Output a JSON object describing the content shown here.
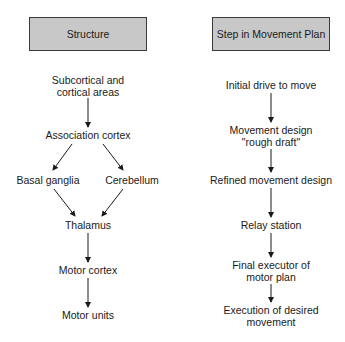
{
  "columns": {
    "left": {
      "header": "Structure",
      "nodes": {
        "subcortical": {
          "line1": "Subcortical and",
          "line2": "cortical areas"
        },
        "association": "Association cortex",
        "basal": "Basal ganglia",
        "cerebellum": "Cerebellum",
        "thalamus": "Thalamus",
        "motor_cortex": "Motor cortex",
        "motor_units": "Motor units"
      }
    },
    "right": {
      "header": "Step in Movement Plan",
      "nodes": {
        "initial": "Initial drive to move",
        "design": {
          "line1": "Movement design",
          "line2": "\"rough draft\""
        },
        "refined": "Refined movement design",
        "relay": "Relay station",
        "final": {
          "line1": "Final executor of",
          "line2": "motor plan"
        },
        "execution": {
          "line1": "Execution of desired",
          "line2": "movement"
        }
      }
    }
  },
  "edges": [
    [
      "Subcortical and cortical areas",
      "Association cortex"
    ],
    [
      "Association cortex",
      "Basal ganglia"
    ],
    [
      "Association cortex",
      "Cerebellum"
    ],
    [
      "Basal ganglia",
      "Thalamus"
    ],
    [
      "Cerebellum",
      "Thalamus"
    ],
    [
      "Thalamus",
      "Motor cortex"
    ],
    [
      "Motor cortex",
      "Motor units"
    ],
    [
      "Initial drive to move",
      "Movement design \"rough draft\""
    ],
    [
      "Movement design \"rough draft\"",
      "Refined movement design"
    ],
    [
      "Refined movement design",
      "Relay station"
    ],
    [
      "Relay station",
      "Final executor of motor plan"
    ],
    [
      "Final executor of motor plan",
      "Execution of desired movement"
    ]
  ],
  "colors": {
    "header_fill": "#c8c8c8",
    "header_border": "#3a3a3a",
    "text": "#1a1a1a",
    "arrow": "#1a1a1a"
  }
}
